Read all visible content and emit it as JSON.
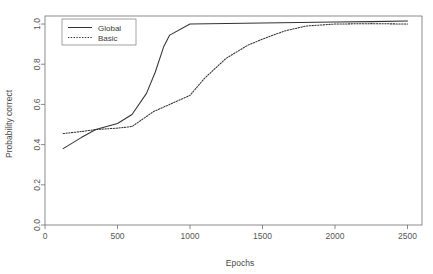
{
  "chart_data": {
    "type": "line",
    "title": "",
    "xlabel": "Epochs",
    "ylabel": "Probability correct",
    "xlim": [
      0,
      2600
    ],
    "ylim": [
      0.0,
      1.04
    ],
    "grid": false,
    "legend_position": "top-left",
    "xticks": [
      0,
      500,
      1000,
      1500,
      2000,
      2500
    ],
    "xtick_labels": [
      "0",
      "500",
      "1000",
      "1500",
      "2000",
      "2500"
    ],
    "yticks": [
      0.0,
      0.2,
      0.4,
      0.6,
      0.8,
      1.0
    ],
    "ytick_labels": [
      "0.0",
      "0.2",
      "0.4",
      "0.6",
      "0.8",
      "1.0"
    ],
    "series": [
      {
        "name": "Global",
        "style": "solid",
        "color": "#333333",
        "x": [
          125,
          250,
          350,
          500,
          600,
          700,
          760,
          820,
          860,
          1000,
          1250,
          1500,
          1750,
          2000,
          2250,
          2500
        ],
        "y": [
          0.38,
          0.435,
          0.475,
          0.505,
          0.55,
          0.655,
          0.76,
          0.89,
          0.945,
          1.0,
          1.003,
          1.005,
          1.008,
          1.01,
          1.012,
          1.015
        ]
      },
      {
        "name": "Basic",
        "style": "dashed",
        "color": "#333333",
        "x": [
          125,
          250,
          350,
          500,
          600,
          750,
          1000,
          1100,
          1250,
          1400,
          1500,
          1650,
          1800,
          2000,
          2250,
          2500
        ],
        "y": [
          0.455,
          0.465,
          0.475,
          0.482,
          0.49,
          0.565,
          0.645,
          0.73,
          0.83,
          0.895,
          0.925,
          0.965,
          0.99,
          1.0,
          1.002,
          1.0
        ]
      }
    ]
  },
  "legend": {
    "entries": [
      {
        "label": "Global"
      },
      {
        "label": "Basic"
      }
    ]
  },
  "axes": {
    "x_title": "Epochs",
    "y_title": "Probability correct"
  }
}
